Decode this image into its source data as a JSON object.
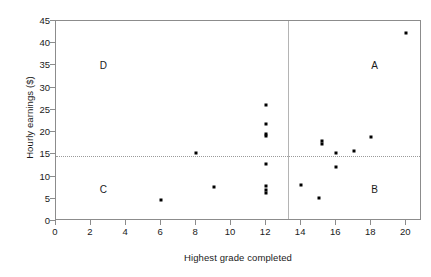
{
  "chart_data": {
    "type": "scatter",
    "title": "",
    "xlabel": "Highest grade completed",
    "ylabel": "Hourly earnings ($)",
    "xlim": [
      0,
      20.9
    ],
    "ylim": [
      0,
      45
    ],
    "xticks": [
      0,
      2,
      4,
      6,
      8,
      10,
      12,
      14,
      16,
      18,
      20
    ],
    "yticks": [
      0,
      5,
      10,
      15,
      20,
      25,
      30,
      35,
      40,
      45
    ],
    "grid": false,
    "legend": null,
    "reference_lines": [
      {
        "orientation": "horizontal",
        "value": 14.6,
        "style": "dotted"
      },
      {
        "orientation": "vertical",
        "value": 13.25,
        "style": "solid"
      }
    ],
    "annotations": [
      {
        "label": "D",
        "x": 2.7,
        "y": 35.0
      },
      {
        "label": "A",
        "x": 18.2,
        "y": 35.0
      },
      {
        "label": "C",
        "x": 2.7,
        "y": 7.3
      },
      {
        "label": "B",
        "x": 18.2,
        "y": 7.3
      }
    ],
    "points": [
      {
        "x": 6,
        "y": 4.7
      },
      {
        "x": 8,
        "y": 15.2
      },
      {
        "x": 9,
        "y": 7.7
      },
      {
        "x": 12,
        "y": 26.2
      },
      {
        "x": 12,
        "y": 21.8
      },
      {
        "x": 12,
        "y": 19.5
      },
      {
        "x": 12,
        "y": 19.1
      },
      {
        "x": 12,
        "y": 12.8
      },
      {
        "x": 12,
        "y": 7.8
      },
      {
        "x": 12,
        "y": 7.0
      },
      {
        "x": 12,
        "y": 6.2
      },
      {
        "x": 14,
        "y": 8.2
      },
      {
        "x": 15,
        "y": 5.2
      },
      {
        "x": 15.2,
        "y": 18.1
      },
      {
        "x": 15.2,
        "y": 17.3
      },
      {
        "x": 16,
        "y": 15.2
      },
      {
        "x": 16,
        "y": 12.2
      },
      {
        "x": 17,
        "y": 15.7
      },
      {
        "x": 18,
        "y": 18.8
      },
      {
        "x": 20,
        "y": 42.2
      }
    ]
  }
}
